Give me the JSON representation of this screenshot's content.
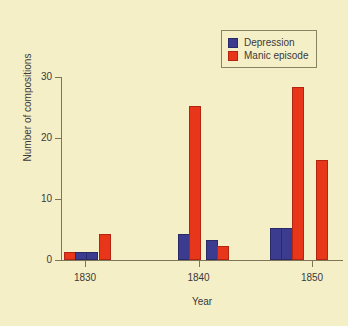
{
  "chart_data": {
    "type": "bar",
    "title": "",
    "xlabel": "Year",
    "ylabel": "Number of compositions",
    "xlim": [
      1826,
      1854
    ],
    "ylim": [
      0,
      30
    ],
    "yticks": [
      0,
      10,
      20,
      30
    ],
    "xticks": [
      1830,
      1840,
      1850
    ],
    "xticklabels": [
      "1830",
      "1840",
      "1850"
    ],
    "yticklabels": [
      "0",
      "10",
      "20",
      "30"
    ],
    "grid": false,
    "legend_position": "top-right",
    "legend": [
      {
        "name": "Depression",
        "color": "#3b3b8f"
      },
      {
        "name": "Manic episode",
        "color": "#e8361b"
      }
    ],
    "series": [
      {
        "name": "Depression",
        "color": "#3b3b8f",
        "points": [
          {
            "x": 1829,
            "y": 1
          },
          {
            "x": 1830,
            "y": 1
          },
          {
            "x": 1839,
            "y": 4
          },
          {
            "x": 1841,
            "y": 3
          },
          {
            "x": 1848,
            "y": 5
          },
          {
            "x": 1849,
            "y": 5
          }
        ]
      },
      {
        "name": "Manic episode",
        "color": "#e8361b",
        "points": [
          {
            "x": 1828,
            "y": 1
          },
          {
            "x": 1831,
            "y": 4
          },
          {
            "x": 1840,
            "y": 25
          },
          {
            "x": 1842,
            "y": 2
          },
          {
            "x": 1850,
            "y": 28
          },
          {
            "x": 1852,
            "y": 16
          }
        ]
      }
    ],
    "bars": [
      {
        "series": "Manic episode",
        "x": 1828,
        "value": 1,
        "left": 64,
        "width": 10
      },
      {
        "series": "Depression",
        "x": 1829,
        "value": 1,
        "left": 75,
        "width": 10
      },
      {
        "series": "Depression",
        "x": 1830,
        "value": 1,
        "left": 86,
        "width": 10
      },
      {
        "series": "Manic episode",
        "x": 1831,
        "value": 4,
        "left": 99,
        "width": 10
      },
      {
        "series": "Depression",
        "x": 1839,
        "value": 4,
        "left": 178,
        "width": 10
      },
      {
        "series": "Manic episode",
        "x": 1840,
        "value": 25,
        "left": 189,
        "width": 10
      },
      {
        "series": "Depression",
        "x": 1841,
        "value": 3,
        "left": 206,
        "width": 10
      },
      {
        "series": "Manic episode",
        "x": 1842,
        "value": 2,
        "left": 217,
        "width": 10
      },
      {
        "series": "Depression",
        "x": 1848,
        "value": 5,
        "left": 270,
        "width": 10
      },
      {
        "series": "Depression",
        "x": 1849,
        "value": 5,
        "left": 281,
        "width": 10
      },
      {
        "series": "Manic episode",
        "x": 1850,
        "value": 28,
        "left": 292,
        "width": 10
      },
      {
        "series": "Manic episode",
        "x": 1852,
        "value": 16,
        "left": 316,
        "width": 10
      }
    ],
    "colors": {
      "background": "#f5efc8",
      "axis": "#7c7559",
      "text": "#3a3a3a",
      "depression": "#3b3b8f",
      "manic": "#e8361b"
    }
  }
}
